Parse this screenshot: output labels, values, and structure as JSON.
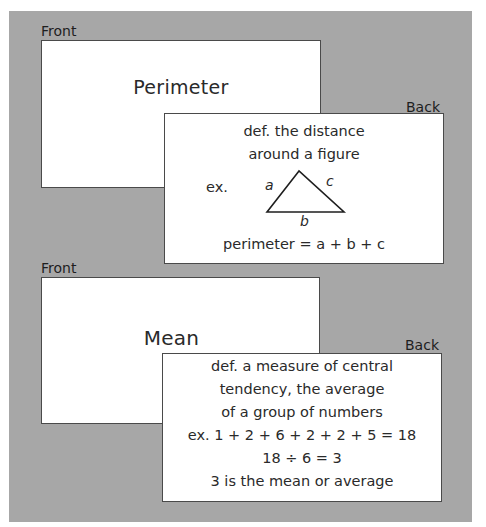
{
  "cards": [
    {
      "front_label": "Front",
      "back_label": "Back",
      "term": "Perimeter",
      "back_lines": [
        "def. the distance",
        "around a figure"
      ],
      "example_prefix": "ex.",
      "triangle_labels": {
        "a": "a",
        "b": "b",
        "c": "c"
      },
      "formula": "perimeter = a + b + c"
    },
    {
      "front_label": "Front",
      "back_label": "Back",
      "term": "Mean",
      "back_lines": [
        "def. a measure of central",
        "tendency, the average",
        "of a group of numbers",
        "ex. 1 + 2 + 6 + 2 + 2 + 5 = 18",
        "18 ÷ 6 = 3",
        "3 is the mean or average"
      ]
    }
  ],
  "colors": {
    "panel_background": "#a7a7a7",
    "card_background": "#ffffff",
    "card_border": "#4a4a4a",
    "text": "#2a2a2a"
  }
}
